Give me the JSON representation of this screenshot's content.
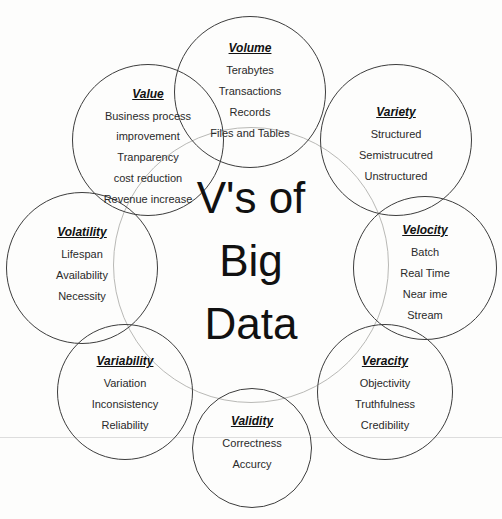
{
  "diagram": {
    "title_lines": [
      "V's of",
      "Big",
      "Data"
    ]
  },
  "circles": [
    {
      "title": "Volume",
      "items": [
        "Terabytes",
        "Transactions",
        "Records",
        "Files and Tables"
      ]
    },
    {
      "title": "Variety",
      "items": [
        "Structured",
        "Semistrucutred",
        "Unstructured"
      ]
    },
    {
      "title": "Velocity",
      "items": [
        "Batch",
        "Real Time",
        "Near ime",
        "Stream"
      ]
    },
    {
      "title": "Veracity",
      "items": [
        "Objectivity",
        "Truthfulness",
        "Credibility"
      ]
    },
    {
      "title": "Validity",
      "items": [
        "Correctness",
        "Accurcy"
      ]
    },
    {
      "title": "Variability",
      "items": [
        "Variation",
        "Inconsistency",
        "Reliability"
      ]
    },
    {
      "title": "Volatility",
      "items": [
        "Lifespan",
        "Availability",
        "Necessity"
      ]
    },
    {
      "title": "Value",
      "items": [
        "Business process improvement",
        "Tranparency",
        "cost reduction",
        "Revenue increase"
      ]
    }
  ],
  "colors": {
    "circle_border": "#3d3d3d",
    "connector_ring": "#b9b9b6",
    "text": "#2a2a2a",
    "title_text": "#111111",
    "background": "#fdfdfc",
    "scan_line": "#dddddd"
  }
}
